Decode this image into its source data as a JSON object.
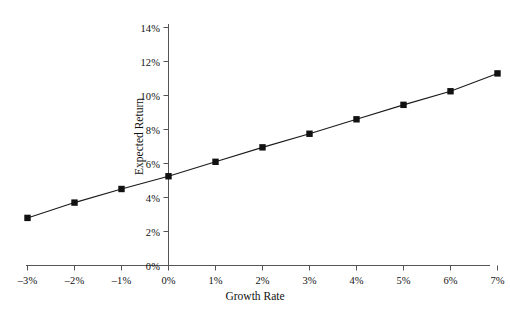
{
  "chart_data": {
    "type": "line",
    "title": "",
    "xlabel": "Growth Rate",
    "ylabel": "Expected Return",
    "x": [
      -3,
      -2,
      -1,
      0,
      1,
      2,
      3,
      4,
      5,
      6,
      7
    ],
    "values": [
      2.8,
      3.7,
      4.5,
      5.25,
      6.1,
      6.95,
      7.75,
      8.6,
      9.45,
      10.25,
      11.3
    ],
    "xtick_labels": [
      "–3%",
      "–2%",
      "–1%",
      "0%",
      "1%",
      "2%",
      "3%",
      "4%",
      "5%",
      "6%",
      "7%"
    ],
    "ytick_values": [
      0,
      2,
      4,
      6,
      8,
      10,
      12,
      14
    ],
    "ytick_labels": [
      "0%",
      "2%",
      "4%",
      "6%",
      "8%",
      "10%",
      "12%",
      "14%"
    ],
    "xlim": [
      -3,
      7
    ],
    "ylim": [
      0,
      14
    ],
    "grid": false,
    "legend": false,
    "marker": "square",
    "line_color": "#1a1a1a",
    "marker_color": "#111111",
    "axis_color": "#444444",
    "background": "#ffffff"
  }
}
